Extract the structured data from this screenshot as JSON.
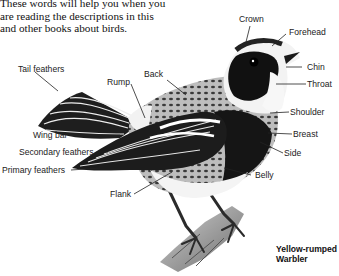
{
  "intro": {
    "lines": [
      "These words will help you when you",
      "are reading the descriptions in this",
      "and other books about birds."
    ]
  },
  "species": {
    "line1": "Yellow-rumped",
    "line2": "Warbler"
  },
  "labels": {
    "crown": "Crown",
    "forehead": "Forehead",
    "chin": "Chin",
    "throat": "Throat",
    "shoulder": "Shoulder",
    "breast": "Breast",
    "side": "Side",
    "belly": "Belly",
    "tail_feathers": "Tail feathers",
    "rump": "Rump",
    "back": "Back",
    "wing_bar": "Wing bar",
    "secondary_feathers": "Secondary feathers",
    "primary_feathers": "Primary feathers",
    "flank": "Flank"
  }
}
